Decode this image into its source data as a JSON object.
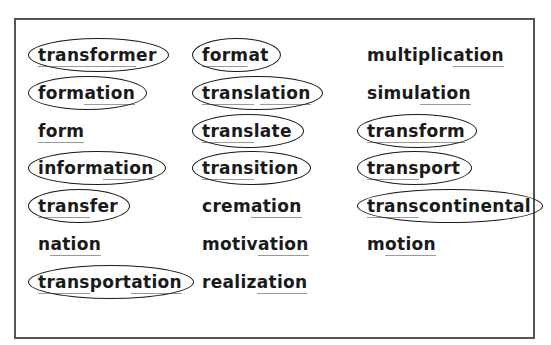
{
  "columns": [
    {
      "words": [
        {
          "text": "transformer",
          "circled": true,
          "segments": [
            {
              "t": "transform",
              "u": true
            },
            {
              "t": "er",
              "u": false
            }
          ]
        },
        {
          "text": "formation",
          "circled": true,
          "segments": [
            {
              "t": "form",
              "u": false
            },
            {
              "t": "ation",
              "u": true
            }
          ]
        },
        {
          "text": "form",
          "circled": false,
          "segments": [
            {
              "t": "form",
              "u": true
            }
          ]
        },
        {
          "text": "information",
          "circled": true,
          "segments": [
            {
              "t": "inform",
              "u": false
            },
            {
              "t": "ation",
              "u": true
            }
          ]
        },
        {
          "text": "transfer",
          "circled": true,
          "segments": [
            {
              "t": "trans",
              "u": true
            },
            {
              "t": "fer",
              "u": false
            }
          ]
        },
        {
          "text": "nation",
          "circled": false,
          "segments": [
            {
              "t": "n",
              "u": false
            },
            {
              "t": "ation",
              "u": true
            }
          ]
        },
        {
          "text": "transportation",
          "circled": true,
          "segments": [
            {
              "t": "trans",
              "u": true
            },
            {
              "t": "port",
              "u": false
            },
            {
              "t": "ation",
              "u": true
            }
          ]
        }
      ]
    },
    {
      "words": [
        {
          "text": "format",
          "circled": true,
          "segments": [
            {
              "t": "form",
              "u": true
            },
            {
              "t": "at",
              "u": false
            }
          ]
        },
        {
          "text": "translation",
          "circled": true,
          "segments": [
            {
              "t": "trans",
              "u": true
            },
            {
              "t": "l",
              "u": false
            },
            {
              "t": "ation",
              "u": true
            }
          ]
        },
        {
          "text": "translate",
          "circled": true,
          "segments": [
            {
              "t": "trans",
              "u": true
            },
            {
              "t": "late",
              "u": false
            }
          ]
        },
        {
          "text": "transition",
          "circled": true,
          "segments": [
            {
              "t": "trans",
              "u": true
            },
            {
              "t": "ition",
              "u": false
            }
          ]
        },
        {
          "text": "cremation",
          "circled": false,
          "segments": [
            {
              "t": "crem",
              "u": false
            },
            {
              "t": "ation",
              "u": true
            }
          ]
        },
        {
          "text": "motivation",
          "circled": false,
          "segments": [
            {
              "t": "motiv",
              "u": false
            },
            {
              "t": "ation",
              "u": true
            }
          ]
        },
        {
          "text": "realization",
          "circled": false,
          "segments": [
            {
              "t": "realiz",
              "u": false
            },
            {
              "t": "ation",
              "u": true
            }
          ]
        }
      ]
    },
    {
      "words": [
        {
          "text": "multiplication",
          "circled": false,
          "segments": [
            {
              "t": "multiplic",
              "u": false
            },
            {
              "t": "ation",
              "u": true
            }
          ]
        },
        {
          "text": "simulation",
          "circled": false,
          "segments": [
            {
              "t": "simul",
              "u": false
            },
            {
              "t": "ation",
              "u": true
            }
          ]
        },
        {
          "text": "transform",
          "circled": true,
          "segments": [
            {
              "t": "transform",
              "u": true
            }
          ]
        },
        {
          "text": "transport",
          "circled": true,
          "segments": [
            {
              "t": "trans",
              "u": true
            },
            {
              "t": "port",
              "u": false
            }
          ]
        },
        {
          "text": "transcontinental",
          "circled": true,
          "segments": [
            {
              "t": "trans",
              "u": true
            },
            {
              "t": "continental",
              "u": false
            }
          ]
        },
        {
          "text": "motion",
          "circled": false,
          "segments": [
            {
              "t": "m",
              "u": false
            },
            {
              "t": "otion",
              "u": true
            }
          ]
        }
      ]
    }
  ],
  "layout": {
    "col_x": [
      38,
      202,
      367
    ],
    "row_y": [
      44,
      82,
      120,
      157,
      195,
      233,
      271
    ]
  }
}
